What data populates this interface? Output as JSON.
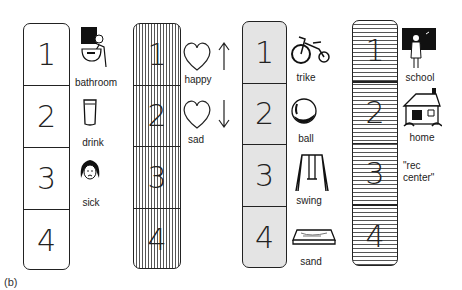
{
  "caption": "(b)",
  "strips": [
    {
      "id": "plain",
      "pattern": "plain",
      "numbers": [
        "1",
        "2",
        "3",
        "4"
      ],
      "items": [
        {
          "label": "bathroom",
          "icon": "bathroom-icon"
        },
        {
          "label": "drink",
          "icon": "cup-icon"
        },
        {
          "label": "sick",
          "icon": "sick-face-icon"
        }
      ]
    },
    {
      "id": "vertical",
      "pattern": "vertical-lines",
      "numbers": [
        "1",
        "2",
        "3",
        "4"
      ],
      "items": [
        {
          "label": "happy",
          "icon": "heart-up-icon"
        },
        {
          "label": "sad",
          "icon": "heart-down-icon"
        }
      ]
    },
    {
      "id": "dotted",
      "pattern": "dotted",
      "numbers": [
        "1",
        "2",
        "3",
        "4"
      ],
      "items": [
        {
          "label": "trike",
          "icon": "tricycle-icon"
        },
        {
          "label": "ball",
          "icon": "ball-icon"
        },
        {
          "label": "swing",
          "icon": "swing-icon"
        },
        {
          "label": "sand",
          "icon": "sandbox-icon"
        }
      ]
    },
    {
      "id": "horizontal",
      "pattern": "horizontal-lines",
      "numbers": [
        "1",
        "2",
        "3",
        "4"
      ],
      "items": [
        {
          "label": "school",
          "icon": "school-icon"
        },
        {
          "label": "home",
          "icon": "house-icon"
        },
        {
          "label": "\"rec\ncenter\"",
          "icon": null
        }
      ]
    }
  ]
}
